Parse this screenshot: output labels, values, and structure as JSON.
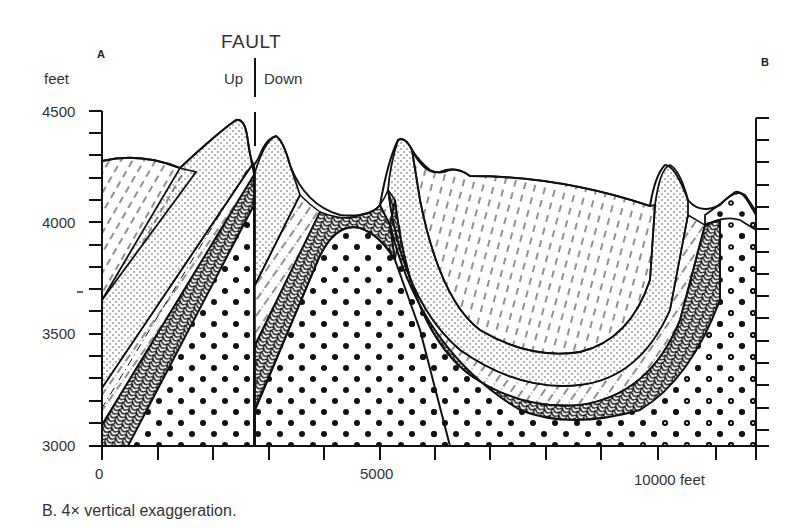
{
  "diagram": {
    "caption": "B. 4× vertical exaggeration.",
    "endpoints": {
      "left": "A",
      "right": "B"
    },
    "fault": {
      "title": "FAULT",
      "up_label": "Up",
      "down_label": "Down"
    },
    "y_axis": {
      "unit_label": "feet",
      "ticks": [
        "4500",
        "4000",
        "3500",
        "3000"
      ],
      "minor_tick_interval": 100
    },
    "x_axis": {
      "ticks": [
        "0",
        "5000",
        "10000 feet"
      ],
      "minor_tick_interval": 1000
    },
    "layers": [
      {
        "name": "dashed-shale-top",
        "pattern": "dashed lines"
      },
      {
        "name": "fine-sandstone",
        "pattern": "fine dots"
      },
      {
        "name": "dash-dot-layer",
        "pattern": "dash-dot lines"
      },
      {
        "name": "contorted-layer",
        "pattern": "wavy/vermicular"
      },
      {
        "name": "coarse-conglomerate",
        "pattern": "large dots / circles"
      }
    ],
    "colors": {
      "ink": "#111111",
      "text": "#333333",
      "background": "#ffffff"
    }
  }
}
